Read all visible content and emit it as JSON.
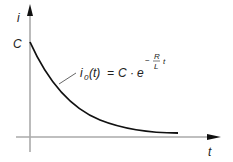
{
  "diagram": {
    "type": "exponential-decay-graph",
    "y_axis_label": "i",
    "x_axis_label": "t",
    "y_intercept_label": "C",
    "formula": {
      "lhs": "i",
      "lhs_subscript": "0",
      "lhs_arg": "(t)",
      "equals": "=",
      "coef": "C",
      "dot": "·",
      "base": "e",
      "exp_sign": "−",
      "exp_num": "R",
      "exp_den": "L",
      "exp_var": "t"
    },
    "colors": {
      "axis": "#aaaaaa",
      "arrow": "#111111",
      "curve": "#111111",
      "text": "#222222",
      "leader": "#555555"
    }
  }
}
